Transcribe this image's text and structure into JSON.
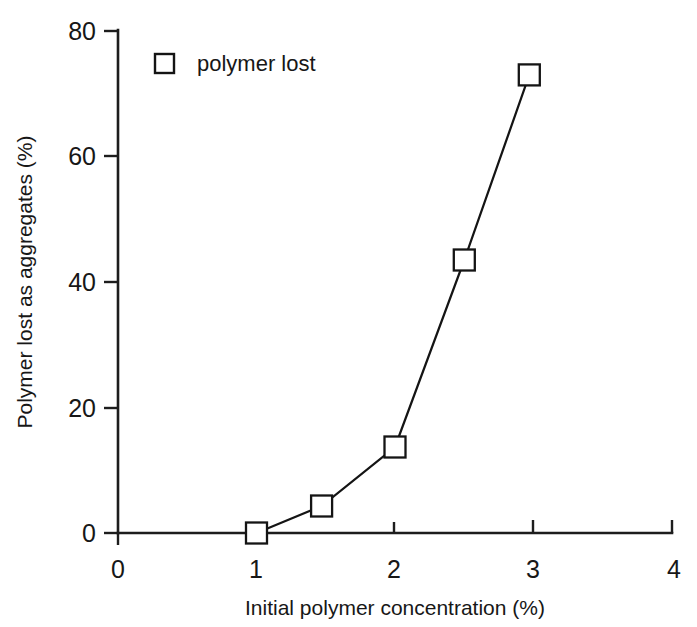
{
  "chart_data": {
    "type": "line",
    "title": "",
    "subtitle": "",
    "xlabel": "Initial polymer concentration (%)",
    "ylabel": "Polymer lost as aggregates (%)",
    "xlim": [
      0,
      4
    ],
    "ylim": [
      0,
      80
    ],
    "xticks": [
      "0",
      "1",
      "2",
      "3",
      "4"
    ],
    "xtick_values": [
      0,
      1,
      2,
      3,
      4
    ],
    "yticks": [
      "0",
      "20",
      "40",
      "60",
      "80"
    ],
    "ytick_values": [
      0,
      20,
      40,
      60,
      80
    ],
    "grid": false,
    "legend_position": "top-left-inside",
    "marker": "open-square",
    "series": [
      {
        "name": "polymer lost",
        "x": [
          1.0,
          1.47,
          2.0,
          2.5,
          2.97
        ],
        "values": [
          0.0,
          4.3,
          13.7,
          43.5,
          73.0
        ]
      }
    ]
  },
  "legend": {
    "entries": [
      {
        "label": "polymer lost",
        "marker": "open-square"
      }
    ]
  },
  "axes": {
    "x_title": "Initial polymer concentration (%)",
    "y_title": "Polymer lost as aggregates (%)"
  },
  "colors": {
    "line": "#141414",
    "marker_fill": "#ffffff",
    "marker_stroke": "#141414",
    "axis": "#1d1d1d",
    "text": "#171717",
    "background": "#ffffff"
  }
}
